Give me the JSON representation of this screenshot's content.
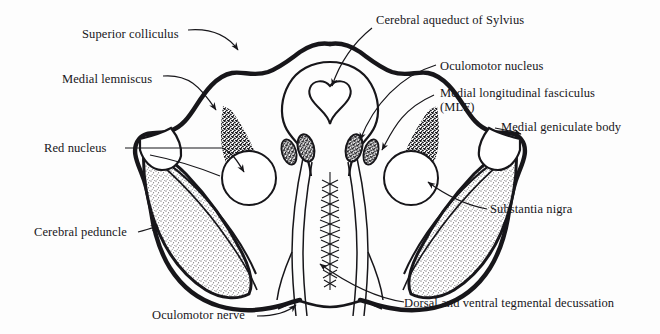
{
  "figure": {
    "type": "anatomical-line-diagram",
    "background_color": "#fdfdfd",
    "ink_color": "#17161a"
  },
  "labels": {
    "superior_colliculus": "Superior colliculus",
    "medial_lemniscus": "Medial lemniscus",
    "red_nucleus": "Red nucleus",
    "cerebral_peduncle": "Cerebral peduncle",
    "oculomotor_nerve": "Oculomotor nerve",
    "cerebral_aqueduct": "Cerebral aqueduct of Sylvius",
    "oculomotor_nucleus": "Oculomotor nucleus",
    "mlf_line1": "Medial longitudinal fasciculus",
    "mlf_line2": "(MLF)",
    "medial_geniculate_body": "Medial geniculate body",
    "substantia_nigra": "Substantia nigra",
    "tegmental_decussation": "Dorsal and ventral tegmental decussation"
  },
  "structures": [
    {
      "name": "superior-colliculus",
      "side": "dorsal-midline"
    },
    {
      "name": "cerebral-aqueduct",
      "side": "midline"
    },
    {
      "name": "oculomotor-nucleus",
      "side": "bilateral"
    },
    {
      "name": "medial-longitudinal-fasciculus",
      "side": "bilateral"
    },
    {
      "name": "medial-lemniscus",
      "side": "bilateral"
    },
    {
      "name": "red-nucleus",
      "side": "bilateral"
    },
    {
      "name": "substantia-nigra",
      "side": "bilateral"
    },
    {
      "name": "cerebral-peduncle",
      "side": "bilateral"
    },
    {
      "name": "medial-geniculate-body",
      "side": "bilateral"
    },
    {
      "name": "oculomotor-nerve",
      "side": "bilateral"
    },
    {
      "name": "tegmental-decussation",
      "side": "midline"
    }
  ]
}
